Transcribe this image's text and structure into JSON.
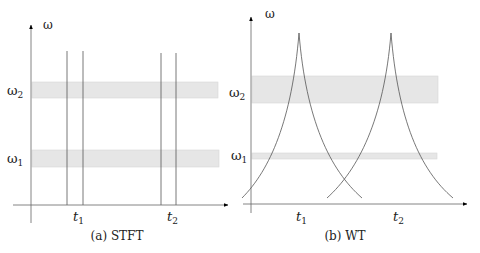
{
  "panels": [
    {
      "id": "stft",
      "caption": "(a) STFT",
      "y_axis_label": "ω",
      "bands": [
        {
          "label": "ω",
          "sub": "2"
        },
        {
          "label": "ω",
          "sub": "1"
        }
      ],
      "time_labels": [
        {
          "label": "t",
          "sub": "1"
        },
        {
          "label": "t",
          "sub": "2"
        }
      ]
    },
    {
      "id": "wt",
      "caption": "(b) WT",
      "y_axis_label": "ω",
      "bands": [
        {
          "label": "ω",
          "sub": "2"
        },
        {
          "label": "ω",
          "sub": "1"
        }
      ],
      "time_labels": [
        {
          "label": "t",
          "sub": "1"
        },
        {
          "label": "t",
          "sub": "2"
        }
      ]
    }
  ],
  "colors": {
    "band_fill": "#e6e6e6",
    "band_stroke": "#d4d4d4",
    "line": "#555555",
    "axis": "#666666"
  }
}
